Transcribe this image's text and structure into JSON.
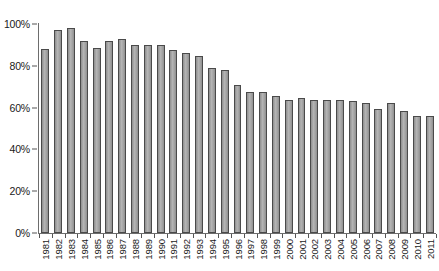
{
  "chart_data": {
    "type": "bar",
    "title": "",
    "subtitle": "",
    "xlabel": "",
    "ylabel": "",
    "ylim": [
      0,
      100
    ],
    "ytick_labels": [
      "100%",
      "80%",
      "60%",
      "40%",
      "20%",
      "0%"
    ],
    "ytick_values": [
      100,
      80,
      60,
      40,
      20,
      0
    ],
    "grid": false,
    "legend": null,
    "legend_position": "none",
    "value_suffix": "%",
    "categories": [
      "1981",
      "1982",
      "1983",
      "1984",
      "1985",
      "1986",
      "1987",
      "1988",
      "1989",
      "1990",
      "1991",
      "1992",
      "1993",
      "1994",
      "1995",
      "1996",
      "1997",
      "1998",
      "1999",
      "2000",
      "2001",
      "2002",
      "2003",
      "2004",
      "2005",
      "2006",
      "2007",
      "2008",
      "2009",
      "2010",
      "2011"
    ],
    "values": [
      88,
      97,
      98,
      92,
      88.5,
      92,
      93,
      90,
      90,
      90,
      87.5,
      86,
      84.5,
      79,
      78,
      71,
      67.5,
      67.5,
      65.5,
      63.5,
      64.5,
      63.5,
      63.5,
      63.5,
      63,
      62,
      59.5,
      62,
      58.5,
      56,
      56
    ],
    "colors": {
      "bar_fill": "#a6a6a6",
      "bar_border": "#4a4a4a",
      "axis": "#6d6d6d",
      "text": "#1a1a1a",
      "background": "#ffffff"
    }
  }
}
